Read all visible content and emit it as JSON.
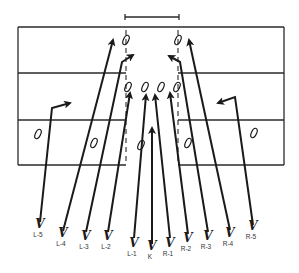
{
  "diagram": {
    "colors": {
      "ink": "#1a1a1a",
      "background": "#ffffff"
    },
    "goalpost": {
      "x1": 125,
      "x2": 179,
      "y": 17
    },
    "field": {
      "left": 18,
      "right": 284,
      "lines_y": [
        27,
        73,
        120,
        165
      ],
      "gap": {
        "left": 126,
        "right": 178
      },
      "dashed_x": [
        126,
        178
      ]
    },
    "returners": [
      {
        "id": "deep-left",
        "x": 126,
        "y": 40
      },
      {
        "id": "deep-right",
        "x": 178,
        "y": 40
      },
      {
        "id": "front-1",
        "x": 128,
        "y": 87
      },
      {
        "id": "front-2",
        "x": 145,
        "y": 87
      },
      {
        "id": "front-3",
        "x": 161,
        "y": 87
      },
      {
        "id": "front-4",
        "x": 177,
        "y": 87
      },
      {
        "id": "wing-left",
        "x": 38,
        "y": 134
      },
      {
        "id": "mid-left",
        "x": 94,
        "y": 143
      },
      {
        "id": "center-low",
        "x": 141,
        "y": 145
      },
      {
        "id": "mid-right",
        "x": 188,
        "y": 143
      },
      {
        "id": "wing-right",
        "x": 254,
        "y": 133
      }
    ],
    "cover_players": [
      {
        "label": "L-5",
        "x": 40,
        "y": 228
      },
      {
        "label": "L-4",
        "x": 63,
        "y": 237
      },
      {
        "label": "L-3",
        "x": 86,
        "y": 240
      },
      {
        "label": "L-2",
        "x": 108,
        "y": 240
      },
      {
        "label": "L-1",
        "x": 134,
        "y": 247
      },
      {
        "label": "K",
        "x": 152,
        "y": 250
      },
      {
        "label": "R-1",
        "x": 170,
        "y": 247
      },
      {
        "label": "R-2",
        "x": 188,
        "y": 242
      },
      {
        "label": "R-3",
        "x": 208,
        "y": 240
      },
      {
        "label": "R-4",
        "x": 230,
        "y": 237
      },
      {
        "label": "R-5",
        "x": 253,
        "y": 230
      }
    ],
    "paths": [
      {
        "player": "L-5",
        "points": [
          [
            40,
            222
          ],
          [
            52,
            108
          ],
          [
            70,
            103
          ]
        ]
      },
      {
        "player": "L-4",
        "points": [
          [
            63,
            231
          ],
          [
            113,
            40
          ]
        ]
      },
      {
        "player": "L-3",
        "points": [
          [
            86,
            232
          ],
          [
            122,
            62
          ],
          [
            133,
            55
          ]
        ]
      },
      {
        "player": "L-2",
        "points": [
          [
            108,
            232
          ],
          [
            130,
            93
          ]
        ]
      },
      {
        "player": "L-1",
        "points": [
          [
            134,
            238
          ],
          [
            146,
            95
          ]
        ]
      },
      {
        "player": "K",
        "points": [
          [
            152,
            244
          ],
          [
            152,
            128
          ]
        ]
      },
      {
        "player": "R-1",
        "points": [
          [
            170,
            238
          ],
          [
            155,
            95
          ]
        ]
      },
      {
        "player": "R-2",
        "points": [
          [
            188,
            234
          ],
          [
            170,
            93
          ]
        ]
      },
      {
        "player": "R-3",
        "points": [
          [
            208,
            232
          ],
          [
            180,
            62
          ],
          [
            169,
            56
          ]
        ]
      },
      {
        "player": "R-4",
        "points": [
          [
            230,
            230
          ],
          [
            189,
            40
          ]
        ]
      },
      {
        "player": "R-5",
        "points": [
          [
            253,
            225
          ],
          [
            235,
            97
          ],
          [
            218,
            103
          ]
        ]
      }
    ]
  }
}
